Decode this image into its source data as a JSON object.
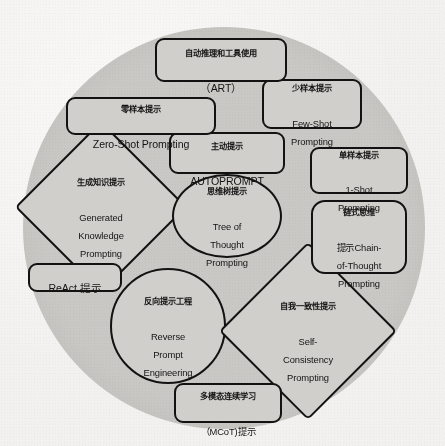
{
  "diagram": {
    "type": "venn-like cluster of labeled shapes inside a large gray circle",
    "background_color": "#f2f1ef",
    "circle_color": "#c9c8c5",
    "node_fill_color": "#d0cfcc",
    "node_stroke_color": "#121212",
    "nodes": [
      {
        "id": "art",
        "shape": "rounded-rectangle",
        "cn": "自动推理和工具使用",
        "en": "（ART）"
      },
      {
        "id": "few_shot",
        "shape": "rounded-rectangle",
        "cn": "少样本提示",
        "en": "Few-Shot\nPrompting"
      },
      {
        "id": "zero_shot",
        "shape": "rounded-rectangle",
        "cn": "零样本提示",
        "en": "Zero-Shot Prompting"
      },
      {
        "id": "autoprompt",
        "shape": "rounded-rectangle",
        "cn": "主动提示",
        "en": "AUTOPROMPT"
      },
      {
        "id": "one_shot",
        "shape": "rounded-rectangle",
        "cn": "单样本提示",
        "en": "1-Shot\nPrompting"
      },
      {
        "id": "generated_knowledge",
        "shape": "diamond",
        "cn": "生成知识提示",
        "en": "Generated\nKnowledge\nPrompting"
      },
      {
        "id": "tree_of_thought",
        "shape": "ellipse",
        "cn": "思维树提示",
        "en": "Tree of\nThought\nPrompting"
      },
      {
        "id": "chain_of_thought",
        "shape": "rounded-rectangle",
        "cn": "链式思维",
        "en": "提示Chain-\nof-Thought\nPrompting"
      },
      {
        "id": "react",
        "shape": "rounded-rectangle",
        "cn": "ReAct 提示",
        "en": ""
      },
      {
        "id": "reverse_prompt",
        "shape": "circle",
        "cn": "反向提示工程",
        "en": "Reverse\nPrompt\nEngineering"
      },
      {
        "id": "self_consistency",
        "shape": "diamond",
        "cn": "自我一致性提示",
        "en": "Self-\nConsistency\nPrompting"
      },
      {
        "id": "mcot",
        "shape": "rounded-rectangle",
        "cn": "多模态连续学习",
        "en": "（MCoT)提示"
      }
    ]
  }
}
